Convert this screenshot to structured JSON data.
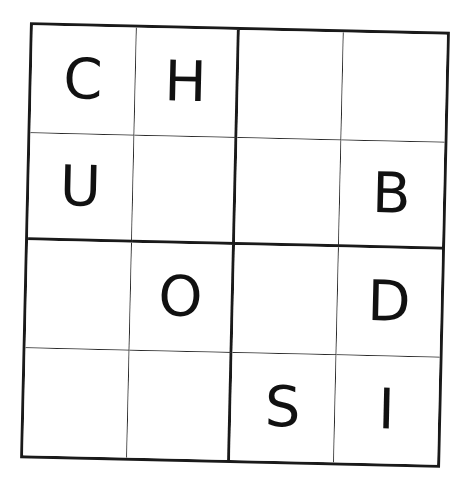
{
  "puzzle": {
    "type": "4x4 letter sudoku",
    "size": 4,
    "box_size": 2,
    "rows": [
      [
        "C",
        "H",
        "",
        ""
      ],
      [
        "U",
        "",
        "",
        "B"
      ],
      [
        "",
        "O",
        "",
        "D"
      ],
      [
        "",
        "",
        "S",
        "I"
      ]
    ],
    "colors": {
      "grid_line": "#1a1a1a",
      "letter": "#111111",
      "background": "#ffffff"
    }
  }
}
